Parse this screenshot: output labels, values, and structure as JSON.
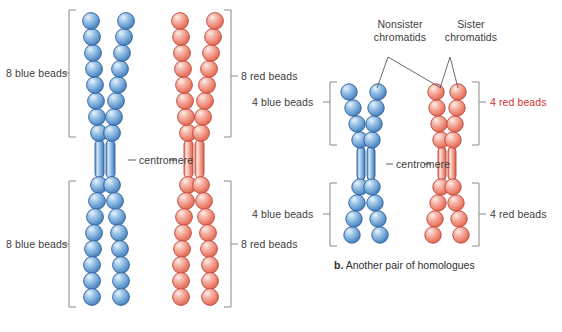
{
  "figure": {
    "caption_b_prefix": "b.",
    "caption_b_text": " Another pair of homologues"
  },
  "colors": {
    "blue_bead_light": "#cfe2f6",
    "blue_bead_mid": "#6fa8dc",
    "blue_bead_dark": "#2f6fb0",
    "blue_outline": "#2d5f9e",
    "red_bead_light": "#fbdcd6",
    "red_bead_mid": "#f08878",
    "red_bead_dark": "#d95a46",
    "red_outline": "#c1453a",
    "bracket": "#8a8a8a",
    "leader": "#5a5a5a",
    "label_text": "#3d3d3d",
    "label_red_text": "#d2322d"
  },
  "panel_a": {
    "labels": {
      "top_left": "8 blue beads",
      "top_right": "8 red beads",
      "bottom_left": "8 blue beads",
      "bottom_right": "8 red beads",
      "centromere": "centromere"
    },
    "chromosomes": [
      {
        "name": "blue-homologue",
        "color": "blue",
        "beads_per_arm_top": 8,
        "beads_per_arm_bottom": 8,
        "chromatids": 2
      },
      {
        "name": "red-homologue",
        "color": "red",
        "beads_per_arm_top": 8,
        "beads_per_arm_bottom": 8,
        "chromatids": 2
      }
    ]
  },
  "panel_b": {
    "labels": {
      "top_left": "4 blue beads",
      "top_right": "4 red beads",
      "bottom_left": "4 blue beads",
      "bottom_right": "4 red beads",
      "centromere": "centromere",
      "nonsister_line1": "Nonsister",
      "nonsister_line2": "chromatids",
      "sister_line1": "Sister",
      "sister_line2": "chromatids"
    },
    "chromosomes": [
      {
        "name": "blue-homologue",
        "color": "blue",
        "beads_per_arm_top": 4,
        "beads_per_arm_bottom": 4,
        "chromatids": 2
      },
      {
        "name": "red-homologue",
        "color": "red",
        "beads_per_arm_top": 4,
        "beads_per_arm_bottom": 4,
        "chromatids": 2
      }
    ]
  }
}
